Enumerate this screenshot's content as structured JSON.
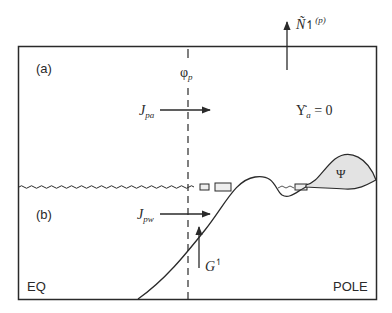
{
  "diagram": {
    "panel_a_label": "(a)",
    "panel_b_label": "(b)",
    "left_label": "EQ",
    "right_label": "POLE",
    "dashed_line_label": {
      "base": "φ",
      "sub": "p"
    },
    "flux_upper": {
      "base": "J",
      "sub": "pa"
    },
    "flux_lower": {
      "base": "J",
      "sub": "pw"
    },
    "top_arrow_label": {
      "base": "Ñ",
      "arrow": "↿",
      "sup": "(p)"
    },
    "steady_state": {
      "base": "Υ̇",
      "sub": "a",
      "rest": " = 0"
    },
    "ground_flux_label": {
      "base": "G",
      "sup": "↿"
    },
    "blob_label": "Ψ",
    "colors": {
      "line": "#2a2a2a",
      "blob_fill": "#e3e3e3",
      "background": "#ffffff"
    }
  }
}
